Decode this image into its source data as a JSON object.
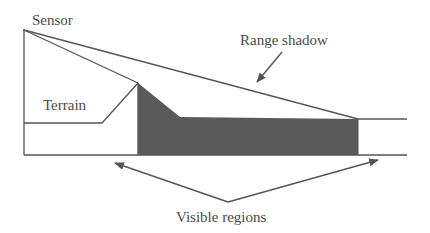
{
  "diagram": {
    "title": "",
    "colors": {
      "line": "#555555",
      "shadow_fill": "#5a5a5a",
      "text": "#4a4a4a",
      "background": "#ffffff"
    },
    "labels": {
      "sensor": "Sensor",
      "range_shadow": "Range shadow",
      "terrain": "Terrain",
      "visible_regions": "Visible regions"
    },
    "nodes": [
      {
        "id": "sensor",
        "label": "Sensor",
        "x": 24,
        "y": 30
      },
      {
        "id": "terrain_peak",
        "x": 138,
        "y": 83
      },
      {
        "id": "shadow_end",
        "x": 358,
        "y": 119
      }
    ],
    "edges": [
      {
        "from": "sensor",
        "to": "terrain_peak",
        "type": "line-of-sight"
      },
      {
        "from": "sensor",
        "to": "shadow_end",
        "type": "line-of-sight"
      },
      {
        "from": "label:Range shadow",
        "to": "shadow region",
        "type": "arrow"
      },
      {
        "from": "label:Visible regions",
        "to": "left visible terrain",
        "type": "arrow"
      },
      {
        "from": "label:Visible regions",
        "to": "right visible terrain",
        "type": "arrow"
      }
    ]
  }
}
